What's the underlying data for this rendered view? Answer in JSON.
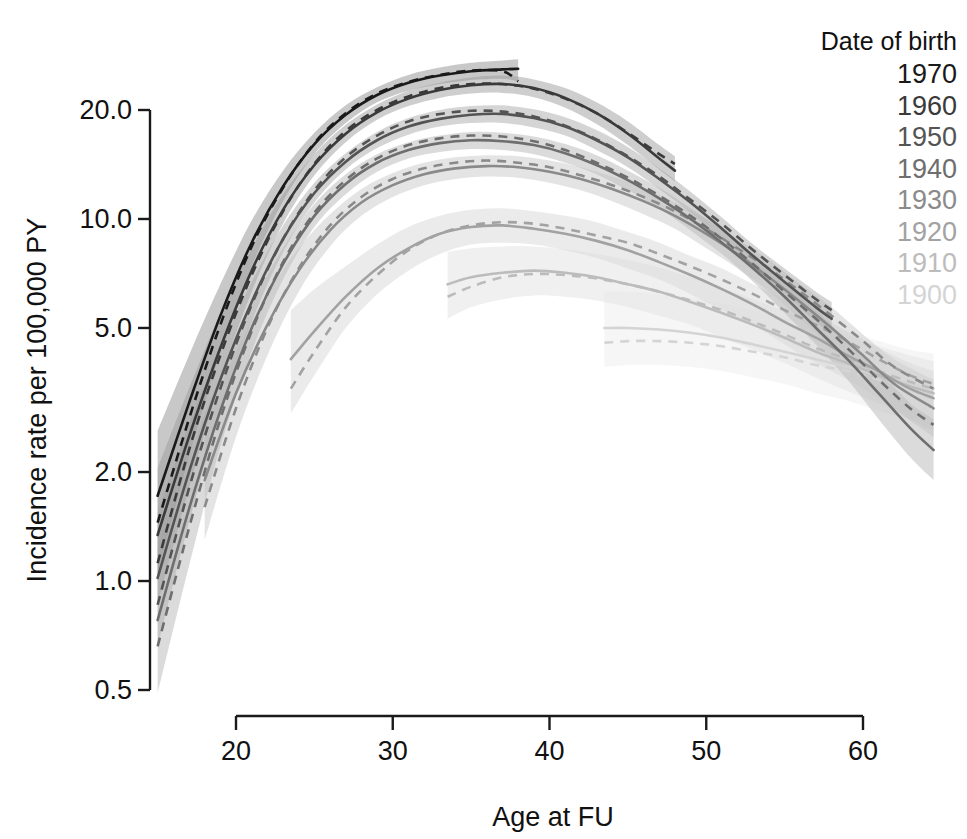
{
  "chart_data": {
    "type": "line",
    "title": "",
    "xlabel": "Age at FU",
    "ylabel": "Incidence rate per 100,000 PY",
    "xlim": [
      14.5,
      65.5
    ],
    "ylim": [
      0.42,
      30.0
    ],
    "yscale": "log10",
    "grid": false,
    "xticks": [
      20,
      30,
      40,
      50,
      60
    ],
    "xtick_labels": [
      "20",
      "30",
      "40",
      "50",
      "60"
    ],
    "yticks": [
      0.5,
      1.0,
      2.0,
      5.0,
      10.0,
      20.0
    ],
    "ytick_labels": [
      "0.5",
      "1.0",
      "2.0",
      "5.0",
      "10.0",
      "20.0"
    ],
    "legend": {
      "title": "Date of birth",
      "position": "top-right",
      "entries": [
        {
          "label": "1970",
          "color": "#1a1a1a"
        },
        {
          "label": "1960",
          "color": "#3a3a3a"
        },
        {
          "label": "1950",
          "color": "#545454"
        },
        {
          "label": "1940",
          "color": "#6e6e6e"
        },
        {
          "label": "1930",
          "color": "#8a8a8a"
        },
        {
          "label": "1920",
          "color": "#a2a2a2"
        },
        {
          "label": "1910",
          "color": "#bcbcbc"
        },
        {
          "label": "1900",
          "color": "#d4d4d4"
        }
      ]
    },
    "line_styles": {
      "fitted": "solid",
      "alternative": "dashed"
    },
    "band_description": "shaded 95% confidence band per cohort",
    "series": [
      {
        "name": "1970",
        "color": "#1a1a1a",
        "band_color": "#9a9a9a",
        "x": [
          15,
          17,
          19,
          21,
          23,
          25,
          27,
          29,
          31,
          33,
          35,
          37,
          38
        ],
        "solid": [
          1.72,
          3.1,
          5.4,
          8.6,
          12.3,
          16.1,
          19.4,
          22.0,
          23.8,
          24.9,
          25.6,
          25.9,
          26.0
        ],
        "dashed": [
          1.45,
          2.8,
          5.1,
          8.4,
          12.2,
          16.2,
          19.6,
          22.2,
          23.9,
          25.0,
          25.7,
          25.6,
          24.0
        ],
        "band_lower": [
          1.05,
          2.2,
          4.3,
          7.4,
          11.2,
          15.1,
          18.4,
          21.0,
          22.6,
          23.6,
          24.2,
          24.4,
          24.0
        ],
        "band_upper": [
          2.6,
          4.2,
          6.6,
          9.9,
          13.6,
          17.3,
          20.6,
          23.1,
          25.0,
          26.2,
          27.0,
          27.4,
          27.6
        ]
      },
      {
        "name": "1960",
        "color": "#3a3a3a",
        "band_color": "#a6a6a6",
        "x": [
          15,
          17,
          19,
          21,
          23,
          25,
          27,
          29,
          31,
          33,
          35,
          37,
          39,
          41,
          43,
          45,
          47,
          48
        ],
        "solid": [
          1.34,
          2.5,
          4.4,
          7.2,
          10.6,
          14.1,
          17.2,
          19.7,
          21.5,
          22.7,
          23.4,
          23.6,
          23.0,
          21.6,
          19.6,
          17.2,
          14.7,
          13.6
        ],
        "dashed": [
          1.12,
          2.3,
          4.2,
          7.0,
          10.5,
          14.2,
          17.5,
          20.0,
          21.8,
          23.0,
          23.6,
          23.6,
          22.9,
          21.5,
          19.6,
          17.3,
          15.1,
          14.2
        ],
        "band_lower": [
          0.86,
          1.8,
          3.6,
          6.3,
          9.7,
          13.2,
          16.3,
          18.8,
          20.5,
          21.6,
          22.2,
          22.3,
          21.7,
          20.3,
          18.3,
          16.0,
          13.7,
          12.7
        ],
        "band_upper": [
          2.05,
          3.4,
          5.5,
          8.3,
          11.7,
          15.1,
          18.2,
          20.7,
          22.6,
          23.8,
          24.6,
          24.9,
          24.3,
          23.0,
          21.0,
          18.6,
          16.0,
          14.9
        ]
      },
      {
        "name": "1950",
        "color": "#545454",
        "band_color": "#b2b2b2",
        "x": [
          15,
          17,
          19,
          21,
          23,
          25,
          27,
          29,
          31,
          33,
          35,
          37,
          39,
          41,
          43,
          45,
          47,
          49,
          51,
          53,
          55,
          57,
          58
        ],
        "solid": [
          1.02,
          2.0,
          3.6,
          5.9,
          8.8,
          11.8,
          14.4,
          16.5,
          18.0,
          18.9,
          19.4,
          19.5,
          19.0,
          18.0,
          16.5,
          14.8,
          12.9,
          11.1,
          9.4,
          7.9,
          6.7,
          5.7,
          5.3
        ],
        "dashed": [
          0.86,
          1.8,
          3.4,
          5.8,
          8.8,
          12.0,
          14.8,
          17.0,
          18.6,
          19.5,
          19.9,
          19.8,
          19.2,
          18.1,
          16.6,
          14.9,
          13.1,
          11.3,
          9.7,
          8.2,
          7.0,
          6.0,
          5.6
        ],
        "band_lower": [
          0.66,
          1.45,
          2.95,
          5.2,
          8.1,
          11.1,
          13.7,
          15.7,
          17.1,
          18.0,
          18.4,
          18.4,
          17.9,
          17.0,
          15.5,
          13.9,
          12.1,
          10.4,
          8.8,
          7.4,
          6.2,
          5.2,
          4.8
        ],
        "band_upper": [
          1.55,
          2.7,
          4.4,
          6.7,
          9.6,
          12.6,
          15.2,
          17.4,
          19.0,
          20.0,
          20.5,
          20.6,
          20.1,
          19.1,
          17.6,
          15.8,
          13.8,
          11.9,
          10.1,
          8.5,
          7.3,
          6.3,
          5.9
        ]
      },
      {
        "name": "1940",
        "color": "#6e6e6e",
        "band_color": "#bebebe",
        "x": [
          15,
          17,
          19,
          21,
          23,
          25,
          27,
          29,
          31,
          33,
          35,
          37,
          39,
          41,
          43,
          45,
          47,
          49,
          51,
          53,
          55,
          57,
          59,
          61,
          63,
          64.5
        ],
        "solid": [
          0.78,
          1.58,
          2.95,
          5.0,
          7.5,
          10.2,
          12.5,
          14.3,
          15.5,
          16.2,
          16.5,
          16.4,
          16.0,
          15.2,
          14.1,
          12.8,
          11.4,
          10.0,
          8.6,
          7.3,
          6.1,
          5.0,
          4.1,
          3.3,
          2.65,
          2.3
        ],
        "dashed": [
          0.66,
          1.4,
          2.8,
          4.9,
          7.6,
          10.4,
          12.8,
          14.7,
          16.0,
          16.7,
          17.0,
          16.9,
          16.4,
          15.5,
          14.3,
          13.0,
          11.6,
          10.2,
          8.8,
          7.5,
          6.3,
          5.3,
          4.4,
          3.6,
          3.0,
          2.7
        ],
        "band_lower": [
          0.49,
          1.1,
          2.35,
          4.3,
          6.8,
          9.5,
          11.7,
          13.5,
          14.7,
          15.3,
          15.6,
          15.5,
          15.1,
          14.3,
          13.3,
          12.0,
          10.7,
          9.3,
          8.0,
          6.7,
          5.5,
          4.5,
          3.6,
          2.8,
          2.2,
          1.9
        ],
        "band_upper": [
          1.22,
          2.2,
          3.7,
          5.8,
          8.3,
          11.0,
          13.3,
          15.1,
          16.3,
          17.0,
          17.4,
          17.3,
          16.9,
          16.1,
          15.0,
          13.6,
          12.2,
          10.7,
          9.3,
          7.9,
          6.7,
          5.6,
          4.6,
          3.8,
          3.1,
          2.8
        ]
      },
      {
        "name": "1930",
        "color": "#8a8a8a",
        "band_color": "#cdcdcd",
        "x": [
          18,
          20,
          22,
          24,
          26,
          28,
          30,
          32,
          34,
          36,
          38,
          40,
          42,
          44,
          46,
          48,
          50,
          52,
          54,
          56,
          58,
          60,
          62,
          64.5
        ],
        "solid": [
          1.9,
          3.3,
          5.1,
          7.2,
          9.3,
          11.1,
          12.4,
          13.3,
          13.8,
          14.0,
          13.9,
          13.5,
          12.9,
          12.1,
          11.2,
          10.2,
          9.1,
          8.0,
          6.9,
          5.9,
          5.0,
          4.2,
          3.5,
          3.0
        ],
        "dashed": [
          1.6,
          3.0,
          5.0,
          7.3,
          9.6,
          11.5,
          12.9,
          13.8,
          14.3,
          14.5,
          14.3,
          13.9,
          13.2,
          12.4,
          11.5,
          10.5,
          9.4,
          8.3,
          7.3,
          6.3,
          5.4,
          4.6,
          3.9,
          3.4
        ],
        "band_lower": [
          1.3,
          2.5,
          4.2,
          6.3,
          8.4,
          10.2,
          11.5,
          12.4,
          12.9,
          13.1,
          13.0,
          12.6,
          12.0,
          11.2,
          10.3,
          9.4,
          8.3,
          7.3,
          6.3,
          5.3,
          4.4,
          3.7,
          3.0,
          2.5
        ],
        "band_upper": [
          2.7,
          4.3,
          6.2,
          8.3,
          10.3,
          12.1,
          13.4,
          14.3,
          14.8,
          15.0,
          14.9,
          14.5,
          13.9,
          13.1,
          12.2,
          11.1,
          10.0,
          8.8,
          7.7,
          6.6,
          5.7,
          4.8,
          4.1,
          3.6
        ]
      },
      {
        "name": "1920",
        "color": "#a2a2a2",
        "band_color": "#dadada",
        "x": [
          23.5,
          25,
          27,
          29,
          31,
          33,
          35,
          37,
          39,
          41,
          43,
          45,
          47,
          49,
          51,
          53,
          55,
          57,
          59,
          61,
          63,
          64.5
        ],
        "solid": [
          4.1,
          4.9,
          6.1,
          7.3,
          8.3,
          9.1,
          9.5,
          9.6,
          9.4,
          9.1,
          8.7,
          8.2,
          7.6,
          7.0,
          6.4,
          5.8,
          5.2,
          4.7,
          4.2,
          3.8,
          3.4,
          3.2
        ],
        "dashed": [
          3.4,
          4.3,
          5.7,
          7.0,
          8.2,
          9.1,
          9.6,
          9.8,
          9.7,
          9.4,
          9.0,
          8.6,
          8.0,
          7.4,
          6.8,
          6.2,
          5.6,
          5.1,
          4.6,
          4.1,
          3.7,
          3.5
        ],
        "band_lower": [
          2.9,
          3.7,
          5.0,
          6.2,
          7.2,
          8.0,
          8.5,
          8.6,
          8.5,
          8.2,
          7.8,
          7.3,
          6.8,
          6.2,
          5.6,
          5.1,
          4.5,
          4.0,
          3.6,
          3.2,
          2.8,
          2.6
        ],
        "band_upper": [
          5.6,
          6.4,
          7.4,
          8.5,
          9.5,
          10.2,
          10.6,
          10.7,
          10.5,
          10.2,
          9.8,
          9.2,
          8.6,
          7.9,
          7.3,
          6.6,
          6.0,
          5.4,
          4.9,
          4.4,
          4.0,
          3.8
        ]
      },
      {
        "name": "1910",
        "color": "#bcbcbc",
        "band_color": "#e4e4e4",
        "x": [
          33.5,
          35,
          37,
          39,
          41,
          43,
          45,
          47,
          49,
          51,
          53,
          55,
          57,
          59,
          61,
          63,
          64.5
        ],
        "solid": [
          6.6,
          6.9,
          7.1,
          7.2,
          7.1,
          6.9,
          6.6,
          6.3,
          5.9,
          5.5,
          5.1,
          4.7,
          4.3,
          4.0,
          3.7,
          3.45,
          3.3
        ],
        "dashed": [
          6.1,
          6.5,
          6.9,
          7.05,
          7.0,
          6.85,
          6.6,
          6.3,
          5.95,
          5.6,
          5.2,
          4.8,
          4.4,
          4.1,
          3.8,
          3.55,
          3.4
        ],
        "band_lower": [
          5.3,
          5.7,
          6.0,
          6.15,
          6.1,
          5.95,
          5.7,
          5.4,
          5.1,
          4.7,
          4.35,
          4.0,
          3.65,
          3.35,
          3.1,
          2.9,
          2.8
        ],
        "band_upper": [
          8.1,
          8.3,
          8.4,
          8.4,
          8.25,
          8.0,
          7.7,
          7.35,
          6.9,
          6.45,
          6.0,
          5.55,
          5.1,
          4.75,
          4.45,
          4.2,
          4.05
        ]
      },
      {
        "name": "1900",
        "color": "#d4d4d4",
        "band_color": "#efefef",
        "x": [
          43.5,
          45,
          47,
          49,
          51,
          53,
          55,
          57,
          59,
          61,
          63,
          64.5
        ],
        "solid": [
          5.0,
          5.0,
          4.95,
          4.85,
          4.7,
          4.5,
          4.3,
          4.1,
          3.9,
          3.7,
          3.5,
          3.4
        ],
        "dashed": [
          4.55,
          4.6,
          4.6,
          4.55,
          4.45,
          4.3,
          4.15,
          3.95,
          3.8,
          3.6,
          3.45,
          3.35
        ],
        "band_lower": [
          3.9,
          3.95,
          3.95,
          3.9,
          3.8,
          3.65,
          3.5,
          3.3,
          3.15,
          2.95,
          2.8,
          2.7
        ],
        "band_upper": [
          6.3,
          6.3,
          6.2,
          6.05,
          5.85,
          5.6,
          5.35,
          5.1,
          4.85,
          4.6,
          4.35,
          4.25
        ]
      }
    ]
  },
  "axes": {
    "x_title": "Age at FU",
    "y_title": "Incidence rate per 100,000 PY"
  }
}
